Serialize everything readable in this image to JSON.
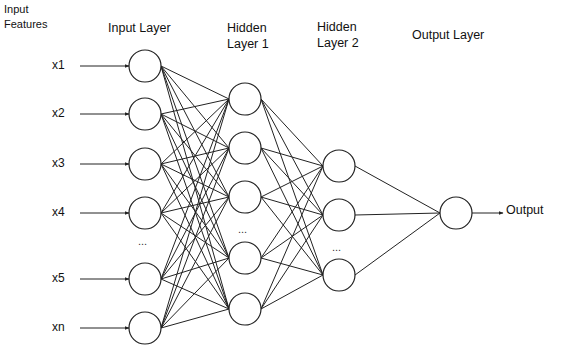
{
  "headers": {
    "input_features": [
      "Input",
      "Features"
    ],
    "input_layer": "Input Layer",
    "hidden1": [
      "Hidden",
      "Layer 1"
    ],
    "hidden2": [
      "Hidden",
      "Layer 2"
    ],
    "output_layer": "Output Layer"
  },
  "input_features": [
    "x1",
    "x2",
    "x3",
    "x4",
    "x5",
    "xn"
  ],
  "output_label": "Output",
  "ellipsis": "...",
  "style": {
    "stroke": "#222222",
    "node_fill": "#ffffff",
    "background": "#ffffff"
  },
  "layers": [
    {
      "name": "input",
      "x": 145,
      "r": 16,
      "nodes_y": [
        66,
        114,
        164,
        213,
        279,
        328
      ],
      "ellipsis_y": 245
    },
    {
      "name": "hidden1",
      "x": 245,
      "r": 16,
      "nodes_y": [
        99,
        148,
        197,
        258,
        309
      ],
      "ellipsis_y": 233
    },
    {
      "name": "hidden2",
      "x": 339,
      "r": 16,
      "nodes_y": [
        166,
        215,
        275
      ],
      "ellipsis_y": 251
    },
    {
      "name": "output",
      "x": 456,
      "r": 16,
      "nodes_y": [
        213
      ]
    }
  ]
}
